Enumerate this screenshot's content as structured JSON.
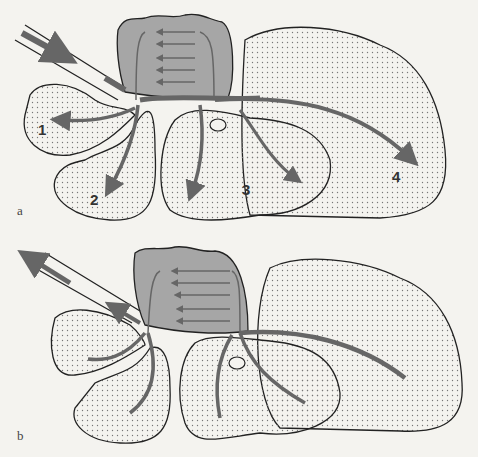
{
  "colors": {
    "background": "#f4f3ef",
    "outline": "#222222",
    "dot_fill": "#888888",
    "gray_region": "#a6a6a6",
    "arrow": "#666666"
  },
  "panels": [
    {
      "label": "a",
      "region_labels": [
        "1",
        "2",
        "3",
        "4"
      ],
      "flow_direction": "inward"
    },
    {
      "label": "b",
      "region_labels": [],
      "flow_direction": "outward"
    }
  ]
}
